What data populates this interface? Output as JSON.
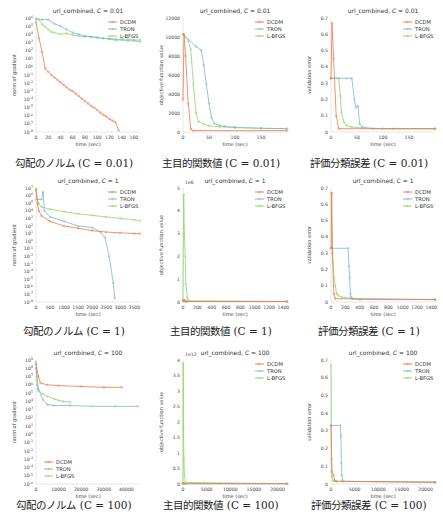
{
  "colors": {
    "DCDM": "#f4784a",
    "TRON": "#7fb7d1",
    "L-BFGS": "#8ed86a",
    "axis": "#aaaaaa"
  },
  "chart_data": [
    {
      "id": "grad_c001",
      "type": "line",
      "title": "url_combined, C = 0.01",
      "caption": "勾配のノルム (C = 0.01)",
      "caption_jp": "勾配のノルム",
      "caption_c": "(C = 0.01)",
      "xlabel": "time (sec)",
      "ylabel": "norm of gradient",
      "yscale": "log",
      "xlim": [
        0,
        170
      ],
      "ylim_exp": [
        -8,
        6
      ],
      "xticks": [
        0,
        20,
        40,
        60,
        80,
        100,
        120,
        140,
        160
      ],
      "yticks": [
        "10^6",
        "10^5",
        "10^4",
        "10^3",
        "10^2",
        "10^1",
        "10^0",
        "10^-1",
        "10^-2",
        "10^-3",
        "10^-4",
        "10^-5",
        "10^-6",
        "10^-7",
        "10^-8"
      ],
      "legend": [
        "DCDM",
        "TRON",
        "L-BFGS"
      ],
      "legend_pos": "upper right",
      "series": [
        {
          "name": "DCDM",
          "x": [
            0,
            5,
            10,
            15,
            20,
            25,
            30,
            35,
            40,
            45,
            50,
            55,
            60,
            65,
            70,
            75,
            80,
            85,
            90,
            95,
            100,
            105,
            110,
            115,
            120,
            125,
            130,
            135
          ],
          "y": [
            5.5,
            3.5,
            1.8,
            -0.2,
            -0.6,
            -1.0,
            -1.3,
            -1.6,
            -1.9,
            -2.2,
            -2.5,
            -2.8,
            -3.0,
            -3.3,
            -3.6,
            -3.9,
            -4.2,
            -4.5,
            -4.8,
            -5.0,
            -5.3,
            -5.6,
            -5.9,
            -6.1,
            -6.4,
            -6.6,
            -6.8,
            -7.8
          ]
        },
        {
          "name": "TRON",
          "x": [
            0,
            10,
            20,
            30,
            40,
            50,
            60,
            70,
            80,
            90,
            100,
            110,
            120,
            130,
            140,
            150,
            160,
            170
          ],
          "y": [
            5.9,
            5.8,
            5.8,
            5.3,
            5.0,
            4.6,
            4.2,
            4.0,
            3.8,
            3.7,
            3.6,
            3.5,
            3.4,
            3.3,
            3.3,
            3.2,
            3.2,
            3.1
          ]
        },
        {
          "name": "L-BFGS",
          "x": [
            0,
            5,
            10,
            15,
            20,
            25,
            30,
            40,
            50,
            60,
            70,
            80,
            90,
            100,
            110,
            120,
            130,
            140,
            150,
            160,
            170
          ],
          "y": [
            5.9,
            5.8,
            5.2,
            4.9,
            4.6,
            4.3,
            4.2,
            4.0,
            4.1,
            3.9,
            3.8,
            3.7,
            3.7,
            3.6,
            3.5,
            3.5,
            3.4,
            3.4,
            3.4,
            3.3,
            3.3
          ]
        }
      ]
    },
    {
      "id": "obj_c001",
      "type": "line",
      "title": "url_combined, C = 0.01",
      "caption": "主目的関数値 (C = 0.01)",
      "caption_jp": "主目的関数値",
      "caption_c": "(C = 0.01)",
      "xlabel": "time (sec)",
      "ylabel": "objective function value",
      "yscale": "linear",
      "xlim": [
        0,
        200
      ],
      "ylim": [
        0,
        12000
      ],
      "xticks": [
        0,
        50,
        100,
        150
      ],
      "yticks": [
        0,
        2000,
        4000,
        6000,
        8000,
        10000,
        12000
      ],
      "legend": [
        "DCDM",
        "TRON",
        "L-BFGS"
      ],
      "legend_pos": "upper right",
      "series": [
        {
          "name": "DCDM",
          "x": [
            0,
            2,
            5,
            10,
            15,
            20,
            200
          ],
          "y": [
            3400,
            10300,
            8000,
            3000,
            300,
            150,
            150
          ]
        },
        {
          "name": "TRON",
          "x": [
            0,
            25,
            35,
            40,
            45,
            50,
            55,
            60,
            70,
            80,
            100,
            150,
            200
          ],
          "y": [
            10300,
            9000,
            8600,
            7000,
            5000,
            3000,
            1500,
            900,
            700,
            600,
            500,
            400,
            350
          ]
        },
        {
          "name": "L-BFGS",
          "x": [
            0,
            10,
            15,
            20,
            25,
            30,
            40,
            50,
            70,
            100,
            150,
            200
          ],
          "y": [
            10300,
            9600,
            8700,
            5000,
            2000,
            1100,
            800,
            650,
            550,
            450,
            380,
            350
          ]
        }
      ]
    },
    {
      "id": "err_c001",
      "type": "line",
      "title": "url_combined, C = 0.01",
      "caption": "評価分類誤差 (C = 0.01)",
      "caption_jp": "評価分類誤差",
      "caption_c": "(C = 0.01)",
      "xlabel": "time (sec)",
      "ylabel": "validation error",
      "yscale": "linear",
      "xlim": [
        0,
        200
      ],
      "ylim": [
        0,
        0.7
      ],
      "xticks": [
        0,
        50,
        100,
        150
      ],
      "yticks": [
        0.0,
        0.1,
        0.2,
        0.3,
        0.4,
        0.5,
        0.6,
        0.7
      ],
      "legend": [
        "DCDM",
        "TRON",
        "L-BFGS"
      ],
      "legend_pos": "upper right",
      "series": [
        {
          "name": "DCDM",
          "x": [
            0,
            2,
            5,
            10,
            15,
            200
          ],
          "y": [
            0.33,
            0.67,
            0.45,
            0.1,
            0.02,
            0.02
          ]
        },
        {
          "name": "TRON",
          "x": [
            0,
            30,
            40,
            45,
            48,
            52,
            55,
            60,
            80,
            120,
            200
          ],
          "y": [
            0.33,
            0.33,
            0.33,
            0.2,
            0.15,
            0.16,
            0.05,
            0.03,
            0.02,
            0.02,
            0.02
          ]
        },
        {
          "name": "L-BFGS",
          "x": [
            0,
            10,
            15,
            18,
            20,
            25,
            30,
            40,
            60,
            100,
            200
          ],
          "y": [
            0.33,
            0.33,
            0.33,
            0.22,
            0.12,
            0.06,
            0.04,
            0.03,
            0.025,
            0.02,
            0.02
          ]
        }
      ]
    },
    {
      "id": "grad_c1",
      "type": "line",
      "title": "url_combined, C = 1",
      "caption": "勾配のノルム (C = 1)",
      "caption_jp": "勾配のノルム",
      "caption_c": "(C = 1)",
      "xlabel": "time (sec)",
      "ylabel": "norm of gradient",
      "yscale": "log",
      "xlim": [
        0,
        3700
      ],
      "ylim_exp": [
        -8,
        7
      ],
      "xticks": [
        0,
        500,
        1000,
        1500,
        2000,
        2500,
        3000,
        3500
      ],
      "yticks": [
        "10^7",
        "10^6",
        "10^5",
        "10^4",
        "10^3",
        "10^2",
        "10^1",
        "10^0",
        "10^-1",
        "10^-2",
        "10^-3",
        "10^-4",
        "10^-5",
        "10^-6",
        "10^-7",
        "10^-8"
      ],
      "legend": [
        "DCDM",
        "TRON",
        "L-BFGS"
      ],
      "legend_pos": "upper right",
      "series": [
        {
          "name": "DCDM",
          "x": [
            0,
            50,
            100,
            200,
            500,
            1000,
            1500,
            2000,
            2500,
            3000,
            3500,
            3700
          ],
          "y": [
            6.8,
            5.0,
            4.0,
            3.3,
            2.6,
            2.0,
            1.7,
            1.4,
            1.2,
            1.1,
            1.0,
            1.0
          ]
        },
        {
          "name": "TRON",
          "x": [
            0,
            200,
            250,
            300,
            500,
            1000,
            1500,
            2000,
            2300,
            2450,
            2600,
            2750,
            2800
          ],
          "y": [
            5.5,
            5.5,
            6.5,
            4.0,
            3.2,
            2.6,
            2.0,
            1.8,
            1.2,
            0.5,
            -2.0,
            -5.5,
            -7.5
          ]
        },
        {
          "name": "L-BFGS",
          "x": [
            0,
            50,
            100,
            200,
            500,
            1000,
            1500,
            2000,
            2500,
            3000,
            3500,
            3700
          ],
          "y": [
            6.9,
            5.5,
            4.9,
            4.5,
            4.2,
            3.9,
            3.6,
            3.4,
            3.2,
            3.0,
            2.8,
            2.7
          ]
        }
      ]
    },
    {
      "id": "obj_c1",
      "type": "line",
      "title": "url_combined, C = 1",
      "caption": "主目的関数値 (C = 1)",
      "caption_jp": "主目的関数値",
      "caption_c": "(C = 1)",
      "xlabel": "time (sec)",
      "ylabel": "objective function value",
      "yscale": "linear",
      "offset_label": "1e6",
      "xlim": [
        0,
        1450
      ],
      "ylim": [
        0,
        5
      ],
      "xticks": [
        0,
        200,
        400,
        600,
        800,
        1000,
        1200,
        1400
      ],
      "yticks": [
        0,
        1,
        2,
        3,
        4,
        5
      ],
      "legend": [
        "DCDM",
        "TRON",
        "L-BFGS"
      ],
      "legend_pos": "upper right",
      "series": [
        {
          "name": "DCDM",
          "x": [
            0,
            10,
            20,
            40,
            1450
          ],
          "y": [
            0.05,
            0.05,
            0.03,
            0.02,
            0.02
          ]
        },
        {
          "name": "TRON",
          "x": [
            0,
            20,
            40,
            60,
            1450
          ],
          "y": [
            0.1,
            0.08,
            0.05,
            0.03,
            0.02
          ]
        },
        {
          "name": "L-BFGS",
          "x": [
            0,
            10,
            20,
            30,
            40,
            60,
            80,
            1450
          ],
          "y": [
            0.05,
            4.7,
            3.0,
            2.0,
            0.8,
            0.2,
            0.05,
            0.02
          ]
        }
      ]
    },
    {
      "id": "err_c1",
      "type": "line",
      "title": "url_combined, C = 1",
      "caption": "評価分類誤差 (C = 1)",
      "caption_jp": "評価分類誤差",
      "caption_c": "(C = 1)",
      "xlabel": "time (sec)",
      "ylabel": "validation error",
      "yscale": "linear",
      "xlim": [
        0,
        1450
      ],
      "ylim": [
        0,
        0.7
      ],
      "xticks": [
        0,
        200,
        400,
        600,
        800,
        1000,
        1200,
        1400
      ],
      "yticks": [
        0.0,
        0.1,
        0.2,
        0.3,
        0.4,
        0.5,
        0.6,
        0.7
      ],
      "legend": [
        "DCDM",
        "TRON",
        "L-BFGS"
      ],
      "legend_pos": "upper right",
      "series": [
        {
          "name": "DCDM",
          "x": [
            0,
            10,
            20,
            40,
            60,
            1450
          ],
          "y": [
            0.33,
            0.67,
            0.3,
            0.05,
            0.02,
            0.015
          ]
        },
        {
          "name": "TRON",
          "x": [
            0,
            240,
            250,
            260,
            270,
            280,
            300,
            400,
            1450
          ],
          "y": [
            0.33,
            0.33,
            0.22,
            0.15,
            0.05,
            0.03,
            0.02,
            0.015,
            0.015
          ]
        },
        {
          "name": "L-BFGS",
          "x": [
            0,
            20,
            40,
            60,
            80,
            100,
            150,
            300,
            1450
          ],
          "y": [
            0.67,
            0.33,
            0.15,
            0.1,
            0.05,
            0.04,
            0.03,
            0.02,
            0.015
          ]
        }
      ]
    },
    {
      "id": "grad_c100",
      "type": "line",
      "title": "url_combined, C = 100",
      "caption": "勾配のノルム (C = 100)",
      "caption_jp": "勾配のノルム",
      "caption_c": "(C = 100)",
      "xlabel": "time (sec)",
      "ylabel": "norm of gradient",
      "yscale": "log",
      "xlim": [
        0,
        46000
      ],
      "ylim_exp": [
        -6,
        9
      ],
      "xticks": [
        0,
        10000,
        20000,
        30000,
        40000
      ],
      "yticks": [
        "10^9",
        "10^8",
        "10^7",
        "10^6",
        "10^5",
        "10^4",
        "10^3",
        "10^2",
        "10^1",
        "10^0",
        "10^-1",
        "10^-2",
        "10^-3",
        "10^-4",
        "10^-5",
        "10^-6"
      ],
      "legend": [
        "DCDM",
        "TRON",
        "L-BFGS"
      ],
      "legend_pos": "lower left",
      "series": [
        {
          "name": "DCDM",
          "x": [
            0,
            1000,
            2000,
            5000,
            10000,
            20000,
            30000,
            38000
          ],
          "y": [
            8.5,
            7.0,
            6.2,
            6.0,
            5.9,
            5.8,
            5.7,
            5.7
          ]
        },
        {
          "name": "TRON",
          "x": [
            0,
            1000,
            3000,
            5000,
            8000,
            15000,
            25000,
            35000,
            45000
          ],
          "y": [
            8.0,
            5.5,
            4.2,
            3.6,
            3.5,
            3.5,
            3.4,
            3.4,
            3.4
          ]
        },
        {
          "name": "L-BFGS",
          "x": [
            0,
            500,
            1000,
            3000,
            5000,
            8000,
            10000,
            12000,
            15000
          ],
          "y": [
            8.8,
            6.0,
            5.3,
            4.9,
            4.6,
            4.3,
            4.1,
            4.0,
            3.9
          ]
        }
      ]
    },
    {
      "id": "obj_c100",
      "type": "line",
      "title": "url_combined, C = 100",
      "caption": "主目的関数値 (C = 100)",
      "caption_jp": "主目的関数値",
      "caption_c": "(C = 100)",
      "xlabel": "time (sec)",
      "ylabel": "objective function value",
      "yscale": "linear",
      "offset_label": "1e12",
      "xlim": [
        0,
        22000
      ],
      "ylim": [
        0,
        4.0
      ],
      "xticks": [
        0,
        5000,
        10000,
        15000,
        20000
      ],
      "yticks": [
        0.0,
        0.5,
        1.0,
        1.5,
        2.0,
        2.5,
        3.0,
        3.5,
        4.0
      ],
      "legend": [
        "DCDM",
        "TRON",
        "L-BFGS"
      ],
      "legend_pos": "upper right",
      "series": [
        {
          "name": "DCDM",
          "x": [
            0,
            200,
            22000
          ],
          "y": [
            0.02,
            0.01,
            0.01
          ]
        },
        {
          "name": "TRON",
          "x": [
            0,
            200,
            22000
          ],
          "y": [
            0.02,
            0.01,
            0.01
          ]
        },
        {
          "name": "L-BFGS",
          "x": [
            0,
            50,
            100,
            200,
            300,
            500,
            22000
          ],
          "y": [
            0.02,
            3.9,
            1.8,
            0.8,
            0.3,
            0.05,
            0.01
          ]
        }
      ]
    },
    {
      "id": "err_c100",
      "type": "line",
      "title": "url_combined, C = 100",
      "caption": "評価分類誤差 (C = 100)",
      "caption_jp": "評価分類誤差",
      "caption_c": "(C = 100)",
      "xlabel": "time (sec)",
      "ylabel": "validation error",
      "yscale": "linear",
      "xlim": [
        0,
        22000
      ],
      "ylim": [
        0,
        0.7
      ],
      "xticks": [
        0,
        5000,
        10000,
        15000,
        20000
      ],
      "yticks": [
        0.0,
        0.1,
        0.2,
        0.3,
        0.4,
        0.5,
        0.6,
        0.7
      ],
      "legend": [
        "DCDM",
        "TRON",
        "L-BFGS"
      ],
      "legend_pos": "upper right",
      "series": [
        {
          "name": "DCDM",
          "x": [
            0,
            200,
            500,
            800,
            1200,
            22000
          ],
          "y": [
            0.33,
            0.07,
            0.05,
            0.02,
            0.015,
            0.01
          ]
        },
        {
          "name": "TRON",
          "x": [
            0,
            2000,
            2100,
            2200,
            2300,
            2400,
            2600,
            22000
          ],
          "y": [
            0.33,
            0.33,
            0.27,
            0.12,
            0.05,
            0.02,
            0.015,
            0.01
          ]
        },
        {
          "name": "L-BFGS",
          "x": [
            0,
            100,
            200,
            400,
            800,
            22000
          ],
          "y": [
            0.67,
            0.14,
            0.04,
            0.02,
            0.015,
            0.01
          ]
        }
      ]
    }
  ]
}
